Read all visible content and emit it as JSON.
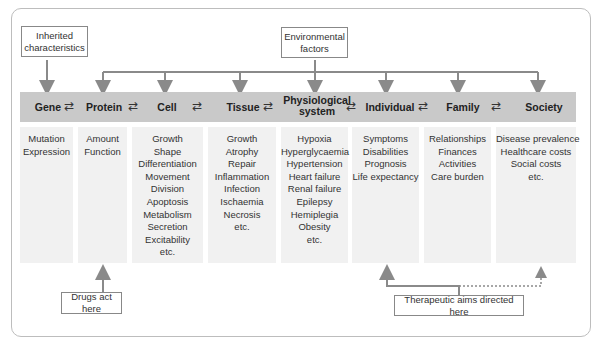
{
  "top_boxes": {
    "inherited": "Inherited characteristics",
    "inherited_line1": "Inherited",
    "inherited_line2": "characteristics",
    "environmental_line1": "Environmental",
    "environmental_line2": "factors"
  },
  "levels": [
    {
      "label": "Gene",
      "items": [
        "Mutation",
        "Expression"
      ]
    },
    {
      "label": "Protein",
      "items": [
        "Amount",
        "Function"
      ]
    },
    {
      "label": "Cell",
      "items": [
        "Growth",
        "Shape",
        "Differentiation",
        "Movement",
        "Division",
        "Apoptosis",
        "Metabolism",
        "Secretion",
        "Excitability",
        "etc."
      ]
    },
    {
      "label": "Tissue",
      "items": [
        "Growth",
        "Atrophy",
        "Repair",
        "Inflammation",
        "Infection",
        "Ischaemia",
        "Necrosis",
        "etc."
      ]
    },
    {
      "label": "Physiological system",
      "label_line1": "Physiological",
      "label_line2": "system",
      "items": [
        "Hypoxia",
        "Hyperglycaemia",
        "Hypertension",
        "Heart failure",
        "Renal failure",
        "Epilepsy",
        "Hemiplegia",
        "Obesity",
        "etc."
      ]
    },
    {
      "label": "Individual",
      "items": [
        "Symptoms",
        "Disabilities",
        "Prognosis",
        "Life expectancy"
      ]
    },
    {
      "label": "Family",
      "items": [
        "Relationships",
        "Finances",
        "Activities",
        "Care burden"
      ]
    },
    {
      "label": "Society",
      "items": [
        "Disease prevalence",
        "Healthcare costs",
        "Social costs",
        "etc."
      ]
    }
  ],
  "bottom_boxes": {
    "drugs": "Drugs act here",
    "therapeutic": "Therapeutic aims directed here"
  },
  "colors": {
    "band": "#c9c9c9",
    "column": "#f1f1f1",
    "arrow": "#8a8a8a",
    "border": "#888888"
  }
}
